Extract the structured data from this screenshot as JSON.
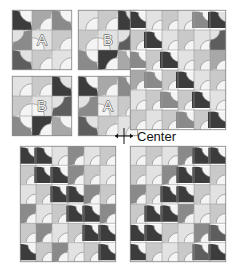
{
  "figure": {
    "annotation": {
      "label": "Center",
      "marker": "crosshair-arrows"
    },
    "palette": {
      "background": "#ffffff",
      "grid_line": "#9a9a9a",
      "block_border": "#8c8c8c",
      "tile_shades": [
        "#f4f4f4",
        "#e2e2e2",
        "#c9c9c9",
        "#a8a8a8",
        "#8a8a8a",
        "#5e5e5e",
        "#3c3c3c"
      ],
      "label_fill": "#f2f2f2",
      "label_stroke": "#3a3a3a",
      "text": "#111111"
    },
    "tile": {
      "description": "square tile with quarter-circle arc; arc sweeps from one corner, dark lobe plus light lobe, thin arc outline",
      "arc_line": "#8f8f8f"
    },
    "blocks": [
      {
        "id": "small-a-top-left",
        "label": "A",
        "rows": 3,
        "cols": 3,
        "x": 12,
        "y": 10,
        "w": 60,
        "h": 60,
        "cells": [
          {
            "rot": 3,
            "dark": 6,
            "light": 0
          },
          {
            "rot": 0,
            "dark": 3,
            "light": 0
          },
          {
            "rot": 3,
            "dark": 4,
            "light": 0
          },
          {
            "rot": 2,
            "dark": 4,
            "light": 1
          },
          {
            "rot": 1,
            "dark": 1,
            "light": 0
          },
          {
            "rot": 0,
            "dark": 2,
            "light": 0
          },
          {
            "rot": 3,
            "dark": 5,
            "light": 1
          },
          {
            "rot": 0,
            "dark": 2,
            "light": 0
          },
          {
            "rot": 0,
            "dark": 1,
            "light": 0
          }
        ]
      },
      {
        "id": "small-b-top-right",
        "label": "B",
        "rows": 3,
        "cols": 3,
        "x": 78,
        "y": 10,
        "w": 60,
        "h": 60,
        "cells": [
          {
            "rot": 0,
            "dark": 1,
            "light": 0
          },
          {
            "rot": 0,
            "dark": 2,
            "light": 0
          },
          {
            "rot": 3,
            "dark": 6,
            "light": 1
          },
          {
            "rot": 0,
            "dark": 2,
            "light": 0
          },
          {
            "rot": 1,
            "dark": 1,
            "light": 0
          },
          {
            "rot": 2,
            "dark": 5,
            "light": 1
          },
          {
            "rot": 3,
            "dark": 4,
            "light": 0
          },
          {
            "rot": 0,
            "dark": 6,
            "light": 0
          },
          {
            "rot": 3,
            "dark": 3,
            "light": 0
          }
        ]
      },
      {
        "id": "small-b-bottom-left",
        "label": "B",
        "rows": 3,
        "cols": 3,
        "x": 12,
        "y": 76,
        "w": 60,
        "h": 60,
        "cells": [
          {
            "rot": 0,
            "dark": 1,
            "light": 0
          },
          {
            "rot": 0,
            "dark": 2,
            "light": 0
          },
          {
            "rot": 3,
            "dark": 6,
            "light": 1
          },
          {
            "rot": 0,
            "dark": 2,
            "light": 0
          },
          {
            "rot": 1,
            "dark": 1,
            "light": 0
          },
          {
            "rot": 2,
            "dark": 5,
            "light": 1
          },
          {
            "rot": 3,
            "dark": 4,
            "light": 0
          },
          {
            "rot": 0,
            "dark": 6,
            "light": 0
          },
          {
            "rot": 3,
            "dark": 3,
            "light": 0
          }
        ]
      },
      {
        "id": "small-a-bottom-right",
        "label": "A",
        "rows": 3,
        "cols": 3,
        "x": 78,
        "y": 76,
        "w": 60,
        "h": 60,
        "cells": [
          {
            "rot": 3,
            "dark": 6,
            "light": 0
          },
          {
            "rot": 0,
            "dark": 3,
            "light": 0
          },
          {
            "rot": 3,
            "dark": 4,
            "light": 0
          },
          {
            "rot": 2,
            "dark": 4,
            "light": 1
          },
          {
            "rot": 1,
            "dark": 1,
            "light": 0
          },
          {
            "rot": 0,
            "dark": 2,
            "light": 0
          },
          {
            "rot": 3,
            "dark": 5,
            "light": 1
          },
          {
            "rot": 0,
            "dark": 2,
            "light": 0
          },
          {
            "rot": 0,
            "dark": 1,
            "light": 0
          }
        ]
      },
      {
        "id": "large-top-right",
        "label": "",
        "rows": 6,
        "cols": 6,
        "x": 130,
        "y": 10,
        "w": 96,
        "h": 120,
        "diagonal": "anti-diagonal dark band running from top-right to bottom-left",
        "cells": [
          {
            "rot": 3,
            "dark": 6,
            "light": 0
          },
          {
            "rot": 0,
            "dark": 1,
            "light": 0
          },
          {
            "rot": 0,
            "dark": 2,
            "light": 0
          },
          {
            "rot": 0,
            "dark": 1,
            "light": 0
          },
          {
            "rot": 3,
            "dark": 4,
            "light": 0
          },
          {
            "rot": 3,
            "dark": 6,
            "light": 1
          },
          {
            "rot": 0,
            "dark": 2,
            "light": 0
          },
          {
            "rot": 3,
            "dark": 6,
            "light": 0
          },
          {
            "rot": 0,
            "dark": 1,
            "light": 0
          },
          {
            "rot": 0,
            "dark": 2,
            "light": 0
          },
          {
            "rot": 0,
            "dark": 1,
            "light": 0
          },
          {
            "rot": 2,
            "dark": 5,
            "light": 1
          },
          {
            "rot": 3,
            "dark": 4,
            "light": 0
          },
          {
            "rot": 0,
            "dark": 2,
            "light": 0
          },
          {
            "rot": 3,
            "dark": 6,
            "light": 0
          },
          {
            "rot": 0,
            "dark": 1,
            "light": 0
          },
          {
            "rot": 0,
            "dark": 2,
            "light": 0
          },
          {
            "rot": 0,
            "dark": 3,
            "light": 0
          },
          {
            "rot": 0,
            "dark": 3,
            "light": 0
          },
          {
            "rot": 3,
            "dark": 4,
            "light": 0
          },
          {
            "rot": 0,
            "dark": 2,
            "light": 0
          },
          {
            "rot": 3,
            "dark": 6,
            "light": 0
          },
          {
            "rot": 0,
            "dark": 1,
            "light": 0
          },
          {
            "rot": 0,
            "dark": 2,
            "light": 0
          },
          {
            "rot": 0,
            "dark": 1,
            "light": 0
          },
          {
            "rot": 0,
            "dark": 2,
            "light": 0
          },
          {
            "rot": 3,
            "dark": 4,
            "light": 0
          },
          {
            "rot": 0,
            "dark": 2,
            "light": 0
          },
          {
            "rot": 3,
            "dark": 6,
            "light": 0
          },
          {
            "rot": 0,
            "dark": 1,
            "light": 0
          },
          {
            "rot": 0,
            "dark": 2,
            "light": 0
          },
          {
            "rot": 0,
            "dark": 1,
            "light": 0
          },
          {
            "rot": 0,
            "dark": 2,
            "light": 0
          },
          {
            "rot": 3,
            "dark": 4,
            "light": 0
          },
          {
            "rot": 0,
            "dark": 2,
            "light": 0
          },
          {
            "rot": 3,
            "dark": 6,
            "light": 0
          }
        ]
      },
      {
        "id": "large-bottom-left",
        "label": "",
        "rows": 6,
        "cols": 6,
        "x": 20,
        "y": 146,
        "w": 96,
        "h": 116,
        "diagonal": "main-diagonal dark band running from top-left to bottom-right",
        "cells": [
          {
            "rot": 3,
            "dark": 6,
            "light": 0
          },
          {
            "rot": 3,
            "dark": 6,
            "light": 0
          },
          {
            "rot": 0,
            "dark": 1,
            "light": 0
          },
          {
            "rot": 0,
            "dark": 4,
            "light": 0
          },
          {
            "rot": 0,
            "dark": 1,
            "light": 0
          },
          {
            "rot": 0,
            "dark": 2,
            "light": 0
          },
          {
            "rot": 0,
            "dark": 2,
            "light": 0
          },
          {
            "rot": 3,
            "dark": 6,
            "light": 0
          },
          {
            "rot": 3,
            "dark": 6,
            "light": 0
          },
          {
            "rot": 0,
            "dark": 4,
            "light": 0
          },
          {
            "rot": 0,
            "dark": 2,
            "light": 0
          },
          {
            "rot": 0,
            "dark": 1,
            "light": 0
          },
          {
            "rot": 0,
            "dark": 1,
            "light": 0
          },
          {
            "rot": 0,
            "dark": 2,
            "light": 0
          },
          {
            "rot": 3,
            "dark": 6,
            "light": 0
          },
          {
            "rot": 3,
            "dark": 6,
            "light": 0
          },
          {
            "rot": 0,
            "dark": 4,
            "light": 0
          },
          {
            "rot": 0,
            "dark": 2,
            "light": 0
          },
          {
            "rot": 0,
            "dark": 4,
            "light": 0
          },
          {
            "rot": 0,
            "dark": 1,
            "light": 0
          },
          {
            "rot": 0,
            "dark": 2,
            "light": 0
          },
          {
            "rot": 3,
            "dark": 6,
            "light": 0
          },
          {
            "rot": 3,
            "dark": 6,
            "light": 0
          },
          {
            "rot": 0,
            "dark": 4,
            "light": 0
          },
          {
            "rot": 0,
            "dark": 2,
            "light": 0
          },
          {
            "rot": 0,
            "dark": 4,
            "light": 0
          },
          {
            "rot": 0,
            "dark": 1,
            "light": 0
          },
          {
            "rot": 0,
            "dark": 2,
            "light": 0
          },
          {
            "rot": 3,
            "dark": 6,
            "light": 0
          },
          {
            "rot": 3,
            "dark": 6,
            "light": 0
          },
          {
            "rot": 3,
            "dark": 6,
            "light": 0
          },
          {
            "rot": 0,
            "dark": 2,
            "light": 0
          },
          {
            "rot": 0,
            "dark": 4,
            "light": 0
          },
          {
            "rot": 0,
            "dark": 1,
            "light": 0
          },
          {
            "rot": 0,
            "dark": 2,
            "light": 0
          },
          {
            "rot": 3,
            "dark": 6,
            "light": 0
          }
        ]
      },
      {
        "id": "large-bottom-right",
        "label": "",
        "rows": 6,
        "cols": 6,
        "x": 130,
        "y": 146,
        "w": 96,
        "h": 116,
        "diagonal": "main-diagonal dark band running from bottom-left to top-right",
        "cells": [
          {
            "rot": 0,
            "dark": 1,
            "light": 0
          },
          {
            "rot": 0,
            "dark": 2,
            "light": 0
          },
          {
            "rot": 0,
            "dark": 1,
            "light": 0
          },
          {
            "rot": 0,
            "dark": 4,
            "light": 0
          },
          {
            "rot": 3,
            "dark": 6,
            "light": 0
          },
          {
            "rot": 3,
            "dark": 6,
            "light": 0
          },
          {
            "rot": 0,
            "dark": 2,
            "light": 0
          },
          {
            "rot": 0,
            "dark": 1,
            "light": 0
          },
          {
            "rot": 0,
            "dark": 4,
            "light": 0
          },
          {
            "rot": 3,
            "dark": 6,
            "light": 0
          },
          {
            "rot": 3,
            "dark": 6,
            "light": 0
          },
          {
            "rot": 0,
            "dark": 2,
            "light": 0
          },
          {
            "rot": 0,
            "dark": 4,
            "light": 0
          },
          {
            "rot": 0,
            "dark": 2,
            "light": 0
          },
          {
            "rot": 3,
            "dark": 6,
            "light": 0
          },
          {
            "rot": 3,
            "dark": 6,
            "light": 0
          },
          {
            "rot": 0,
            "dark": 2,
            "light": 0
          },
          {
            "rot": 0,
            "dark": 1,
            "light": 0
          },
          {
            "rot": 0,
            "dark": 2,
            "light": 0
          },
          {
            "rot": 3,
            "dark": 6,
            "light": 0
          },
          {
            "rot": 3,
            "dark": 6,
            "light": 0
          },
          {
            "rot": 0,
            "dark": 4,
            "light": 0
          },
          {
            "rot": 0,
            "dark": 1,
            "light": 0
          },
          {
            "rot": 0,
            "dark": 2,
            "light": 0
          },
          {
            "rot": 3,
            "dark": 6,
            "light": 0
          },
          {
            "rot": 3,
            "dark": 6,
            "light": 0
          },
          {
            "rot": 0,
            "dark": 2,
            "light": 0
          },
          {
            "rot": 0,
            "dark": 1,
            "light": 0
          },
          {
            "rot": 0,
            "dark": 4,
            "light": 0
          },
          {
            "rot": 3,
            "dark": 5,
            "light": 0
          },
          {
            "rot": 3,
            "dark": 6,
            "light": 0
          },
          {
            "rot": 0,
            "dark": 2,
            "light": 0
          },
          {
            "rot": 0,
            "dark": 1,
            "light": 0
          },
          {
            "rot": 0,
            "dark": 2,
            "light": 0
          },
          {
            "rot": 3,
            "dark": 5,
            "light": 0
          },
          {
            "rot": 3,
            "dark": 6,
            "light": 0
          }
        ]
      }
    ]
  }
}
